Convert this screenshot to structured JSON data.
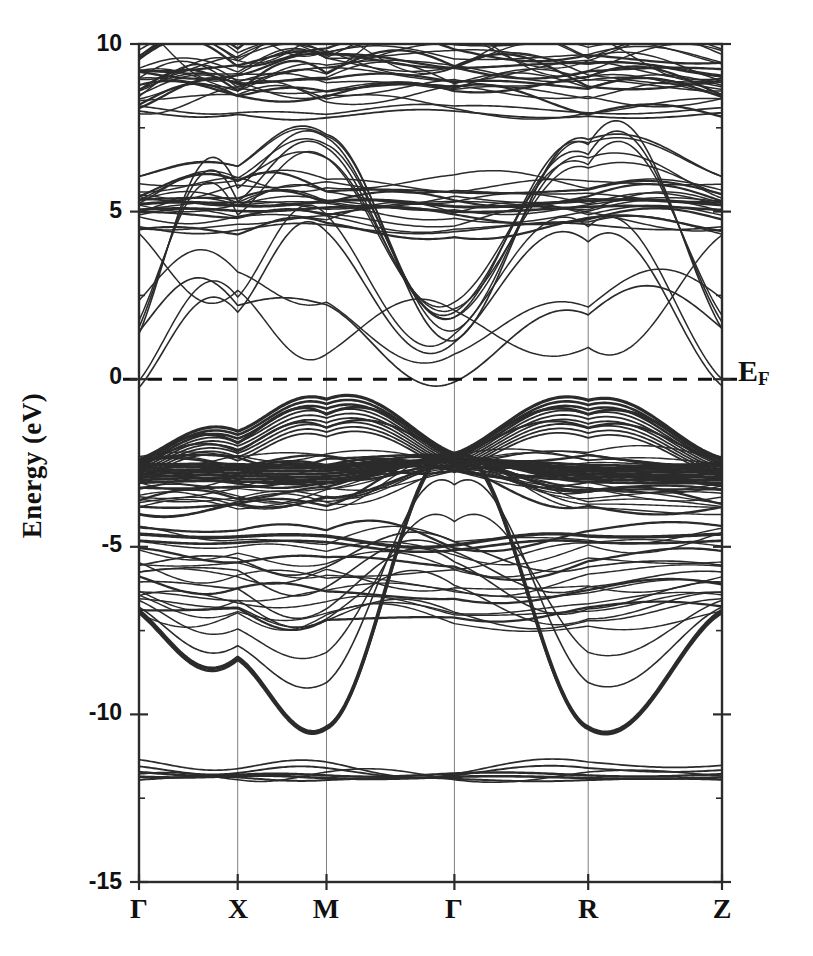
{
  "figure": {
    "type": "band-structure",
    "ylabel": "Energy (eV)",
    "fermi_label": "E",
    "fermi_sub": "F",
    "background": "#ffffff",
    "line_color": "#2b2b2b"
  },
  "chart_data": {
    "type": "line",
    "title": "",
    "subtitle": "",
    "xlabel": "",
    "ylabel": "Energy (eV)",
    "ylim": [
      -15,
      10
    ],
    "yticks": [
      10,
      5,
      0,
      -5,
      -10,
      -15
    ],
    "ytick_labels": [
      "10",
      "5",
      "0",
      "-5",
      "-10",
      "-15"
    ],
    "grid": true,
    "grid_axis": "x",
    "legend": "none",
    "annotations": [
      {
        "text": "E_F",
        "value": 0,
        "style": "dashed-horizontal-line",
        "position": "right-outside"
      }
    ],
    "x_high_symmetry_points": [
      "Γ",
      "X",
      "M",
      "Γ",
      "R",
      "Z"
    ],
    "x_segment_fractions": [
      0.0,
      0.1693,
      0.3216,
      0.541,
      0.7705,
      1.0
    ],
    "axes_pixels": {
      "left": 139,
      "right": 722,
      "top": 44,
      "bottom": 882
    },
    "series": [
      {
        "name": "conduction-manifold-upper",
        "energy_range": [
          7.6,
          10.0
        ],
        "values": [
          8.9,
          8.2,
          8.6,
          8.3,
          8.5,
          8.4
        ]
      },
      {
        "name": "conduction-band-isolated",
        "energy_range": [
          1.1,
          10.0
        ],
        "values": [
          6.0,
          6.3,
          7.3,
          1.2,
          7.1,
          6.0
        ]
      },
      {
        "name": "conduction-manifold-mid",
        "energy_range": [
          4.3,
          6.3
        ],
        "values": [
          5.2,
          5.1,
          5.3,
          4.6,
          5.4,
          5.2
        ]
      },
      {
        "name": "free-electron-like",
        "energy_range": [
          -0.3,
          10.0
        ],
        "values": [
          1.4,
          2.2,
          2.2,
          -0.1,
          1.9,
          1.5
        ]
      },
      {
        "name": "valence-manifold-top",
        "energy_range": [
          -3.0,
          -0.5
        ],
        "values": [
          -2.4,
          -1.6,
          -0.6,
          -2.2,
          -0.6,
          -2.3
        ]
      },
      {
        "name": "valence-manifold-core",
        "energy_range": [
          -4.0,
          -2.0
        ],
        "values": [
          -2.6,
          -2.8,
          -2.9,
          -2.4,
          -2.9,
          -2.7
        ]
      },
      {
        "name": "valence-manifold-lower",
        "energy_range": [
          -7.3,
          -4.2
        ],
        "values": [
          -4.6,
          -4.7,
          -4.7,
          -5.0,
          -4.7,
          -4.6
        ]
      },
      {
        "name": "deep-dispersive-band",
        "energy_range": [
          -10.4,
          -2.2
        ],
        "values": [
          -6.9,
          -8.3,
          -10.4,
          -2.2,
          -10.4,
          -6.9
        ]
      },
      {
        "name": "semicore-flat-bands",
        "energy_range": [
          -12.0,
          -11.3
        ],
        "values": [
          -11.6,
          -11.8,
          -11.5,
          -11.8,
          -11.5,
          -11.7
        ]
      }
    ]
  },
  "y_axis": {
    "ticks": [
      {
        "value": 10,
        "label": "10"
      },
      {
        "value": 5,
        "label": "5"
      },
      {
        "value": 0,
        "label": "0"
      },
      {
        "value": -5,
        "label": "-5"
      },
      {
        "value": -10,
        "label": "-10"
      },
      {
        "value": -15,
        "label": "-15"
      }
    ]
  },
  "x_axis": {
    "ticks": [
      {
        "label": "Γ",
        "fraction": 0.0
      },
      {
        "label": "X",
        "fraction": 0.1693
      },
      {
        "label": "M",
        "fraction": 0.3216
      },
      {
        "label": "Γ",
        "fraction": 0.541
      },
      {
        "label": "R",
        "fraction": 0.7705
      },
      {
        "label": "Z",
        "fraction": 1.0
      }
    ]
  }
}
